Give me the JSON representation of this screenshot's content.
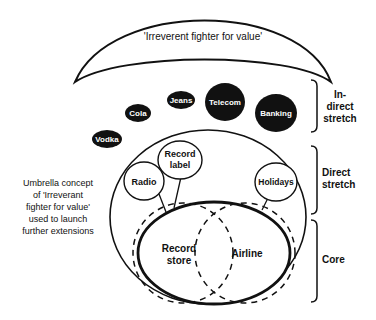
{
  "banner": {
    "label": "'Irreverent fighter for value'"
  },
  "indirect_extensions": [
    {
      "label": "Vodka"
    },
    {
      "label": "Cola"
    },
    {
      "label": "Jeans"
    },
    {
      "label": "Telecom"
    },
    {
      "label": "Banking"
    }
  ],
  "direct_extensions": [
    {
      "label_line1": "Radio"
    },
    {
      "label_line1": "Record",
      "label_line2": "label"
    },
    {
      "label_line1": "Holidays"
    }
  ],
  "core": [
    {
      "label_line1": "Record",
      "label_line2": "store"
    },
    {
      "label_line1": "Airline"
    }
  ],
  "brackets": [
    {
      "line1": "In-",
      "line2": "direct",
      "line3": "stretch"
    },
    {
      "line1": "Direct",
      "line2": "stretch"
    },
    {
      "line1": "Core"
    }
  ],
  "side_note": {
    "lines": [
      "Umbrella concept",
      "of 'Irreverant",
      "fighter for value'",
      "used to launch",
      "further extensions"
    ]
  },
  "colors": {
    "ink": "#111111",
    "background": "#ffffff"
  }
}
